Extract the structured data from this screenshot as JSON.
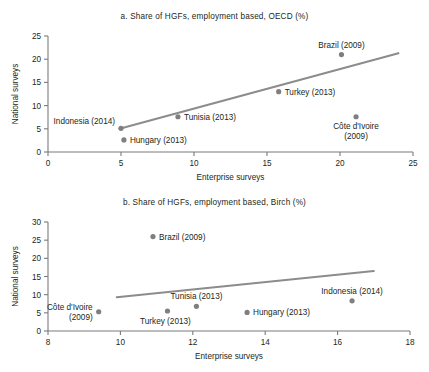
{
  "figure": {
    "background": "#ffffff",
    "marker_color": "#7f7f7f",
    "line_color": "#8c8c8c",
    "axis_color": "#7b7b7b",
    "text_color": "#231f20"
  },
  "chart_data": [
    {
      "type": "scatter",
      "panel": "a",
      "title": "a. Share of HGFs, employment based, OECD (%)",
      "xlabel": "Enterprise surveys",
      "ylabel": "National surveys",
      "xlim": [
        0,
        25
      ],
      "ylim": [
        0,
        25
      ],
      "xticks": [
        0,
        5,
        10,
        15,
        20,
        25
      ],
      "yticks": [
        0,
        5,
        10,
        15,
        20,
        25
      ],
      "xtick_labels": [
        "0",
        "5",
        "10",
        "15",
        "20",
        "25"
      ],
      "ytick_labels": [
        "0",
        "5",
        "10",
        "15",
        "20",
        "25"
      ],
      "grid": false,
      "legend": "none",
      "points": [
        {
          "label": "Indonesia (2014)",
          "x": 5.0,
          "y": 5.1,
          "label_lines": [
            "Indonesia (2014)"
          ],
          "label_anchor": "end",
          "label_dx": -6,
          "label_dy": -4
        },
        {
          "label": "Hungary (2013)",
          "x": 5.2,
          "y": 2.6,
          "label_lines": [
            "Hungary (2013)"
          ],
          "label_anchor": "start",
          "label_dx": 6,
          "label_dy": 3
        },
        {
          "label": "Tunisia (2013)",
          "x": 8.9,
          "y": 7.6,
          "label_lines": [
            "Tunisia (2013)"
          ],
          "label_anchor": "start",
          "label_dx": 6,
          "label_dy": 3
        },
        {
          "label": "Turkey (2013)",
          "x": 15.8,
          "y": 13.0,
          "label_lines": [
            "Turkey (2013)"
          ],
          "label_anchor": "start",
          "label_dx": 6,
          "label_dy": 3
        },
        {
          "label": "Brazil (2009)",
          "x": 20.1,
          "y": 21.0,
          "label_lines": [
            "Brazil (2009)"
          ],
          "label_anchor": "middle",
          "label_dx": 0,
          "label_dy": -7
        },
        {
          "label": "Côte d'Ivoire (2009)",
          "x": 21.1,
          "y": 7.6,
          "label_lines": [
            "Côte d'Ivoire",
            "(2009)"
          ],
          "label_anchor": "middle",
          "label_dx": 0,
          "label_dy": 12
        }
      ],
      "trend_line": {
        "x1": 4.9,
        "y1": 5.0,
        "x2": 24.0,
        "y2": 21.3
      }
    },
    {
      "type": "scatter",
      "panel": "b",
      "title": "b. Share of HGFs, employment based, Birch (%)",
      "xlabel": "Enterprise surveys",
      "ylabel": "National surveys",
      "xlim": [
        8,
        18
      ],
      "ylim": [
        0,
        30
      ],
      "xticks": [
        8,
        10,
        12,
        14,
        16,
        18
      ],
      "yticks": [
        0,
        5,
        10,
        15,
        20,
        25,
        30
      ],
      "xtick_labels": [
        "8",
        "10",
        "12",
        "14",
        "16",
        "18"
      ],
      "ytick_labels": [
        "0",
        "5",
        "10",
        "15",
        "20",
        "25",
        "30"
      ],
      "grid": false,
      "legend": "none",
      "points": [
        {
          "label": "Côte d'Ivoire (2009)",
          "x": 9.4,
          "y": 5.3,
          "label_lines": [
            "Côte d'Ivoire",
            "(2009)"
          ],
          "label_anchor": "end",
          "label_dx": -6,
          "label_dy": -2
        },
        {
          "label": "Brazil (2009)",
          "x": 10.9,
          "y": 26.0,
          "label_lines": [
            "Brazil (2009)"
          ],
          "label_anchor": "start",
          "label_dx": 6,
          "label_dy": 3
        },
        {
          "label": "Turkey (2013)",
          "x": 11.3,
          "y": 5.5,
          "label_lines": [
            "Turkey (2013)"
          ],
          "label_anchor": "middle",
          "label_dx": -2,
          "label_dy": 13
        },
        {
          "label": "Tunisia (2013)",
          "x": 12.1,
          "y": 6.8,
          "label_lines": [
            "Tunisia (2013)"
          ],
          "label_anchor": "middle",
          "label_dx": 0,
          "label_dy": -7
        },
        {
          "label": "Hungary (2013)",
          "x": 13.5,
          "y": 5.1,
          "label_lines": [
            "Hungary (2013)"
          ],
          "label_anchor": "start",
          "label_dx": 6,
          "label_dy": 3
        },
        {
          "label": "Indonesia (2014)",
          "x": 16.4,
          "y": 8.3,
          "label_lines": [
            "Indonesia (2014)"
          ],
          "label_anchor": "middle",
          "label_dx": 0,
          "label_dy": -7
        }
      ],
      "trend_line": {
        "x1": 9.9,
        "y1": 9.3,
        "x2": 17.0,
        "y2": 16.5
      }
    }
  ]
}
